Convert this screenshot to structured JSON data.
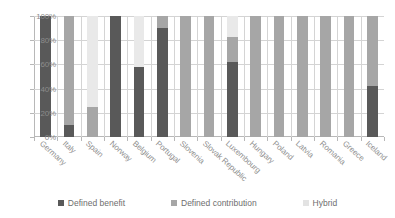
{
  "chart_data": {
    "type": "bar",
    "subtype": "stacked-100-percent",
    "title": "",
    "xlabel": "",
    "ylabel": "",
    "ylim": [
      0,
      100
    ],
    "ytick_labels": [
      "0%",
      "20%",
      "40%",
      "60%",
      "80%",
      "100%"
    ],
    "ytick_values": [
      0,
      20,
      40,
      60,
      80,
      100
    ],
    "grid": true,
    "legend_position": "bottom",
    "categories": [
      "Germany",
      "Italy",
      "Spain",
      "Norway",
      "Belgium",
      "Portugal",
      "Slovenia",
      "Slovak Republic",
      "Luxembourg",
      "Hungary",
      "Poland",
      "Latvia",
      "Romania",
      "Greece",
      "Iceland"
    ],
    "series": [
      {
        "name": "Defined benefit",
        "color": "#595959",
        "values": [
          100,
          10,
          0,
          100,
          58,
          90,
          0,
          0,
          62,
          0,
          0,
          0,
          0,
          0,
          42
        ]
      },
      {
        "name": "Defined contribution",
        "color": "#a6a6a6",
        "values": [
          0,
          90,
          25,
          0,
          0,
          10,
          100,
          100,
          21,
          100,
          100,
          100,
          100,
          100,
          58
        ]
      },
      {
        "name": "Hybrid",
        "color": "#e9e9e9",
        "values": [
          0,
          0,
          75,
          0,
          42,
          0,
          0,
          0,
          17,
          0,
          0,
          0,
          0,
          0,
          0
        ]
      }
    ]
  },
  "legend": {
    "items": [
      {
        "label": "Defined benefit",
        "key": "benefit"
      },
      {
        "label": "Defined contribution",
        "key": "contribution"
      },
      {
        "label": "Hybrid",
        "key": "hybrid"
      }
    ]
  }
}
